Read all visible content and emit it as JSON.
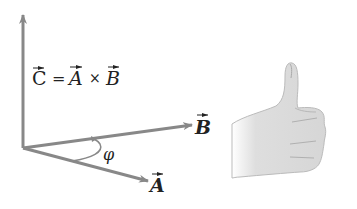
{
  "diagram": {
    "equation": {
      "lhs": "C",
      "eq": "=",
      "a": "A",
      "times": "×",
      "b": "B"
    },
    "vectors": {
      "A": {
        "label": "A"
      },
      "B": {
        "label": "B"
      },
      "C": {
        "label": "C"
      }
    },
    "angle_label": "φ",
    "colors": {
      "arrow": "#888888",
      "text": "#222222",
      "hand_fill": "#dcdcdc",
      "hand_stroke": "#b0b0b0"
    },
    "illustration": "right-hand-thumbs-up"
  }
}
